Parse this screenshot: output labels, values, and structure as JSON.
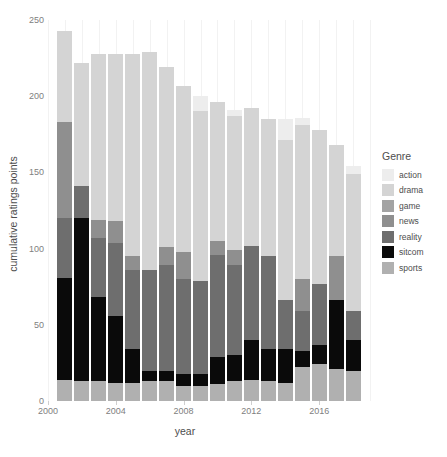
{
  "legend": {
    "title": "Genre",
    "items": [
      {
        "label": "action",
        "color": "#ededed"
      },
      {
        "label": "drama",
        "color": "#d4d4d4"
      },
      {
        "label": "game",
        "color": "#a3a3a3"
      },
      {
        "label": "news",
        "color": "#8f8f8f"
      },
      {
        "label": "reality",
        "color": "#6e6e6e"
      },
      {
        "label": "sitcom",
        "color": "#0a0a0a"
      },
      {
        "label": "sports",
        "color": "#b0b0b0"
      }
    ]
  },
  "chart_data": {
    "type": "bar",
    "stacked": true,
    "title": "",
    "xlabel": "year",
    "ylabel": "cumulative ratings points",
    "xlim": [
      2000,
      2019
    ],
    "ylim": [
      0,
      250
    ],
    "yticks": [
      0,
      50,
      100,
      150,
      200,
      250
    ],
    "xticks": [
      2000,
      2004,
      2008,
      2012,
      2016
    ],
    "grid": "vertical-minor",
    "legend_position": "right",
    "legend_title": "Genre",
    "categories": [
      2001,
      2002,
      2003,
      2004,
      2005,
      2006,
      2007,
      2008,
      2009,
      2010,
      2011,
      2012,
      2013,
      2014,
      2015,
      2016,
      2017,
      2018
    ],
    "series": [
      {
        "name": "sports",
        "color": "#b0b0b0",
        "values": [
          14,
          13,
          13,
          12,
          12,
          13,
          13,
          10,
          10,
          11,
          13,
          14,
          13,
          12,
          22,
          24,
          21,
          20
        ]
      },
      {
        "name": "sitcom",
        "color": "#0a0a0a",
        "values": [
          67,
          107,
          55,
          44,
          22,
          7,
          7,
          8,
          8,
          18,
          17,
          26,
          21,
          22,
          11,
          13,
          45,
          20
        ]
      },
      {
        "name": "reality",
        "color": "#6e6e6e",
        "values": [
          39,
          21,
          39,
          48,
          52,
          66,
          69,
          62,
          61,
          67,
          59,
          62,
          61,
          32,
          26,
          40,
          0,
          19
        ]
      },
      {
        "name": "news",
        "color": "#8f8f8f",
        "values": [
          63,
          0,
          12,
          14,
          9,
          0,
          12,
          18,
          0,
          9,
          10,
          0,
          0,
          0,
          21,
          0,
          29,
          0
        ]
      },
      {
        "name": "game",
        "color": "#a3a3a3",
        "values": [
          0,
          0,
          0,
          0,
          0,
          0,
          0,
          0,
          0,
          0,
          0,
          0,
          0,
          0,
          0,
          0,
          0,
          0
        ]
      },
      {
        "name": "drama",
        "color": "#d4d4d4",
        "values": [
          60,
          81,
          109,
          110,
          133,
          143,
          118,
          109,
          111,
          91,
          88,
          90,
          90,
          105,
          101,
          101,
          73,
          90
        ]
      },
      {
        "name": "action",
        "color": "#ededed",
        "values": [
          0,
          0,
          0,
          0,
          0,
          0,
          0,
          0,
          10,
          0,
          4,
          0,
          0,
          14,
          5,
          0,
          0,
          5
        ]
      }
    ],
    "totals": [
      243,
      222,
      228,
      228,
      228,
      229,
      219,
      207,
      200,
      196,
      191,
      192,
      185,
      185,
      186,
      178,
      168,
      154
    ]
  }
}
